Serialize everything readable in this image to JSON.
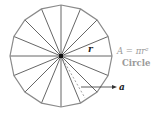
{
  "diagram": {
    "title": "Circle",
    "formula": "A = πr²",
    "radius_label": "r",
    "apothem_label": "a",
    "sectors": 16,
    "colors": {
      "stroke": "#555555",
      "outline": "#8a8a8a",
      "formula_text": "#9a9a9a",
      "label_text": "#222222"
    }
  }
}
